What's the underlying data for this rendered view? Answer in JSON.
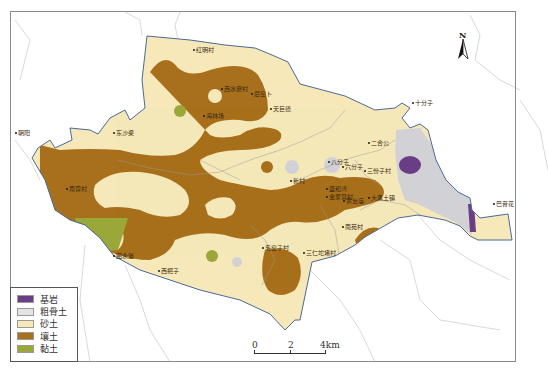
{
  "map": {
    "north_arrow": {
      "label": "N"
    },
    "scale_bar": {
      "ticks": [
        "0",
        "2",
        "4km"
      ]
    },
    "colors": {
      "bedrock": "#6a3f86",
      "skeletal_soil": "#d2d2d6",
      "sandy_soil": "#f6e8b8",
      "loam": "#a8701c",
      "clay": "#9aa83a",
      "boundary": "#4a6a9a",
      "road": "#9a9a9a"
    },
    "legend": {
      "items": [
        {
          "label": "基岩",
          "color": "#6a3f86"
        },
        {
          "label": "粗骨土",
          "color": "#e4e4e6"
        },
        {
          "label": "砂土",
          "color": "#f6e8b8"
        },
        {
          "label": "壤土",
          "color": "#a8701c"
        },
        {
          "label": "黏土",
          "color": "#9aa83a"
        }
      ]
    },
    "places": [
      {
        "name": "红明村",
        "x": 193,
        "y": 47
      },
      {
        "name": "西水磨村",
        "x": 221,
        "y": 86
      },
      {
        "name": "后窑卜",
        "x": 251,
        "y": 91
      },
      {
        "name": "海林场",
        "x": 203,
        "y": 113
      },
      {
        "name": "天巨德",
        "x": 270,
        "y": 106
      },
      {
        "name": "十分子",
        "x": 412,
        "y": 100
      },
      {
        "name": "朝阳",
        "x": 15,
        "y": 130
      },
      {
        "name": "东沙梁",
        "x": 113,
        "y": 130
      },
      {
        "name": "二合公",
        "x": 368,
        "y": 140
      },
      {
        "name": "八分子",
        "x": 328,
        "y": 159
      },
      {
        "name": "六分子",
        "x": 342,
        "y": 164
      },
      {
        "name": "三份子村",
        "x": 364,
        "y": 168
      },
      {
        "name": "新村",
        "x": 290,
        "y": 178
      },
      {
        "name": "南营村",
        "x": 66,
        "y": 186
      },
      {
        "name": "盛和湾",
        "x": 326,
        "y": 186
      },
      {
        "name": "金家营村",
        "x": 326,
        "y": 194
      },
      {
        "name": "黄台庙",
        "x": 343,
        "y": 198
      },
      {
        "name": "大黑土镇",
        "x": 368,
        "y": 195
      },
      {
        "name": "南苑村",
        "x": 342,
        "y": 224
      },
      {
        "name": "巴音花",
        "x": 493,
        "y": 201
      },
      {
        "name": "毛窑子村",
        "x": 262,
        "y": 245
      },
      {
        "name": "三仁坨堵村",
        "x": 303,
        "y": 250
      },
      {
        "name": "图永堡",
        "x": 113,
        "y": 253
      },
      {
        "name": "西把子",
        "x": 158,
        "y": 268
      }
    ]
  }
}
